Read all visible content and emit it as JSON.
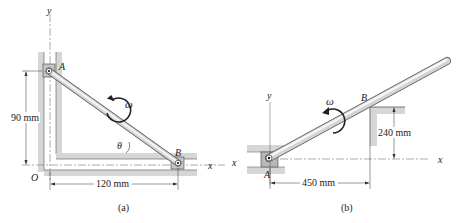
{
  "figure_a": {
    "caption": "(a)",
    "axis_y": "y",
    "axis_x": "x",
    "origin": "O",
    "point_a": "A",
    "point_b": "B",
    "omega": "ω",
    "theta": "θ",
    "dim_vertical": "90 mm",
    "dim_horizontal": "120 mm"
  },
  "figure_b": {
    "caption": "(b)",
    "axis_y": "y",
    "axis_x_left": "x",
    "axis_x_right": "x",
    "point_a": "A",
    "point_b": "B",
    "omega": "ω",
    "dim_vertical": "240 mm",
    "dim_horizontal": "450 mm"
  },
  "colors": {
    "guide": "#d4d4d4",
    "rod_light": "#f2f2f2",
    "rod_dark": "#8a8a8a",
    "ink": "#222222"
  }
}
